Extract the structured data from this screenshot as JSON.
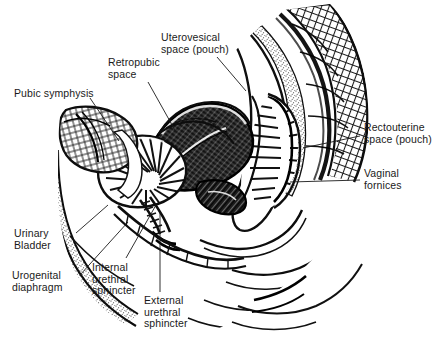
{
  "figure": {
    "background_color": "#ffffff",
    "ink_color": "#111111",
    "width": 435,
    "height": 343
  },
  "labels": [
    {
      "id": "uterovesical-space",
      "text": "Uterovesical\nspace (pouch)",
      "x": 161,
      "y": 32,
      "align": "l",
      "leader": [
        [
          217,
          57
        ],
        [
          246,
          91
        ]
      ]
    },
    {
      "id": "retropubic-space",
      "text": "Retropubic\nspace",
      "x": 108,
      "y": 57,
      "align": "l",
      "leader": [
        [
          148,
          82
        ],
        [
          176,
          132
        ]
      ]
    },
    {
      "id": "pubic-symphysis",
      "text": "Pubic symphysis",
      "x": 14,
      "y": 88,
      "align": "l",
      "leader": [
        [
          90,
          98
        ],
        [
          119,
          141
        ]
      ]
    },
    {
      "id": "rectouterine-space",
      "text": "Rectouterine\nspace (pouch)",
      "x": 364,
      "y": 122,
      "align": "l",
      "leader": [
        [
          360,
          136
        ],
        [
          303,
          148
        ]
      ]
    },
    {
      "id": "vaginal-fornices",
      "text": "Vaginal\nfornices",
      "x": 364,
      "y": 168,
      "align": "l",
      "leader": [
        [
          360,
          180
        ],
        [
          290,
          182
        ]
      ]
    },
    {
      "id": "urinary-bladder",
      "text": "Urinary\nBladder",
      "x": 14,
      "y": 228,
      "align": "l",
      "leader": [
        [
          76,
          233
        ],
        [
          108,
          205
        ]
      ]
    },
    {
      "id": "urogenital-diaphragm",
      "text": "Urogenital\ndiaphragm",
      "x": 12,
      "y": 270,
      "align": "l",
      "leader": [
        [
          80,
          275
        ],
        [
          128,
          222
        ]
      ]
    },
    {
      "id": "internal-urethral-sphincter",
      "text": "Internal\nurethral\nsphincter",
      "x": 92,
      "y": 262,
      "align": "l",
      "leader": [
        [
          126,
          258
        ],
        [
          156,
          205
        ]
      ]
    },
    {
      "id": "external-urethral-sphincter",
      "text": "External\nurethral\nsphincter",
      "x": 144,
      "y": 295,
      "align": "l",
      "leader": [
        [
          160,
          292
        ],
        [
          160,
          212
        ]
      ]
    }
  ]
}
